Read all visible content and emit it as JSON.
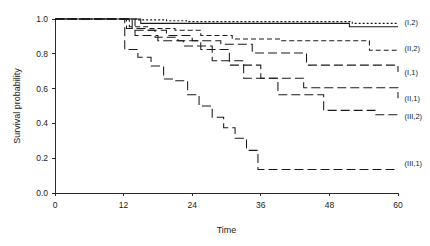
{
  "chart_data": {
    "type": "line",
    "title": "",
    "xlabel": "Time",
    "ylabel": "Survival probability",
    "xlim": [
      0,
      60
    ],
    "ylim": [
      0.0,
      1.0
    ],
    "xticks": [
      0,
      12,
      24,
      36,
      48,
      60
    ],
    "xtick_labels": [
      "0",
      "12",
      "24",
      "36",
      "48",
      "60"
    ],
    "yticks": [
      0.0,
      0.2,
      0.4,
      0.6,
      0.8,
      1.0
    ],
    "ytick_labels": [
      "0.0",
      "0.2",
      "0.4",
      "0.6",
      "0.8",
      "1.0"
    ],
    "grid": false,
    "legend_position": "right-inline-labels",
    "step_shape": "post",
    "series": [
      {
        "name": "(I,2)",
        "label": "(I,2)",
        "linestyle": "dotted",
        "dasharray": "2,2",
        "label_x": 60.8,
        "label_y": 0.985,
        "x": [
          0,
          11.2,
          14.5,
          19.5,
          23.0,
          32.0,
          43.5,
          52.0,
          60
        ],
        "y": [
          1.0,
          1.0,
          0.995,
          0.99,
          0.985,
          0.985,
          0.985,
          0.975,
          0.975
        ]
      },
      {
        "name": "(I,2)-solid-overlay",
        "label": "",
        "linestyle": "solid",
        "dasharray": "none",
        "label_x": null,
        "label_y": null,
        "x": [
          0,
          11.2,
          15.0,
          24.0,
          40.5,
          51.5,
          60
        ],
        "y": [
          1.0,
          1.0,
          0.975,
          0.975,
          0.975,
          0.955,
          0.955
        ]
      },
      {
        "name": "(II,2)",
        "label": "(II,2)",
        "linestyle": "dashed-short",
        "dasharray": "5,3",
        "label_x": 60.8,
        "label_y": 0.835,
        "x": [
          0,
          11.2,
          13.0,
          16.5,
          21.0,
          25.5,
          31.0,
          39.5,
          51.5,
          55.0,
          60
        ],
        "y": [
          1.0,
          1.0,
          0.955,
          0.945,
          0.935,
          0.905,
          0.885,
          0.875,
          0.875,
          0.82,
          0.82
        ]
      },
      {
        "name": "(I,1)",
        "label": "(I,1)",
        "linestyle": "dash-long",
        "dasharray": "9,4",
        "label_x": 60.8,
        "label_y": 0.695,
        "x": [
          0,
          11.0,
          12.5,
          16.0,
          19.5,
          24.0,
          29.0,
          34.5,
          44.0,
          54.5,
          60
        ],
        "y": [
          1.0,
          1.0,
          0.945,
          0.935,
          0.905,
          0.875,
          0.855,
          0.805,
          0.735,
          0.735,
          0.695
        ]
      },
      {
        "name": "(II,1)",
        "label": "(II,1)",
        "linestyle": "dash-long",
        "dasharray": "9,4",
        "label_x": 60.8,
        "label_y": 0.545,
        "x": [
          0,
          10.8,
          13.5,
          17.5,
          21.5,
          25.5,
          30.5,
          36.0,
          43.5,
          54.0,
          60
        ],
        "y": [
          1.0,
          1.0,
          0.935,
          0.895,
          0.875,
          0.825,
          0.735,
          0.66,
          0.605,
          0.605,
          0.545
        ]
      },
      {
        "name": "(III,2)",
        "label": "(III,2)",
        "linestyle": "dash-long",
        "dasharray": "9,4",
        "label_x": 60.8,
        "label_y": 0.445,
        "x": [
          0,
          10.5,
          14.0,
          18.0,
          22.5,
          27.5,
          33.0,
          39.0,
          47.0,
          56.0,
          60
        ],
        "y": [
          1.0,
          1.0,
          0.905,
          0.875,
          0.845,
          0.76,
          0.66,
          0.565,
          0.475,
          0.45,
          0.45
        ]
      },
      {
        "name": "(III,1)",
        "label": "(III,1)",
        "linestyle": "dash-long",
        "dasharray": "9,4",
        "label_x": 60.8,
        "label_y": 0.17,
        "x": [
          0,
          10.2,
          12.2,
          14.5,
          16.8,
          19.0,
          21.0,
          23.2,
          25.2,
          27.5,
          29.5,
          31.5,
          33.5,
          35.5,
          60
        ],
        "y": [
          1.0,
          1.0,
          0.825,
          0.78,
          0.73,
          0.655,
          0.645,
          0.565,
          0.5,
          0.435,
          0.375,
          0.315,
          0.245,
          0.135,
          0.135
        ]
      }
    ]
  },
  "axes": {
    "x_title": "Time",
    "y_title": "Survival probability"
  }
}
